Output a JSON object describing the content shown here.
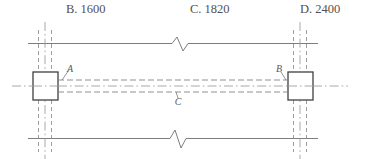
{
  "choices": {
    "items": [
      {
        "id": "choice-b",
        "label": "B. 1600"
      },
      {
        "id": "choice-c",
        "label": "C. 1820"
      },
      {
        "id": "choice-d",
        "label": "D. 2400"
      }
    ]
  },
  "diagram": {
    "type": "engineering-sectional-drawing",
    "labels": [
      {
        "id": "label-a",
        "text": "A",
        "x": 70,
        "y": 50
      },
      {
        "id": "label-b",
        "text": "B",
        "x": 279,
        "y": 50
      },
      {
        "id": "label-c",
        "text": "C",
        "x": 175,
        "y": 80
      }
    ],
    "colors": {
      "line": "#6b6b6b",
      "block_outline": "#3c3c3c",
      "centerline": "#8c8c8c",
      "hidden_line": "#7a7a7a",
      "text": "#555052",
      "background": "#ffffff"
    },
    "geometry": {
      "top_rail_y": 21,
      "bottom_rail_y": 116,
      "rail_left_x": 28,
      "rail_right_x": 318,
      "axis_y": 64,
      "left_block": {
        "x": 33,
        "y": 50,
        "w": 25,
        "h": 28
      },
      "right_block": {
        "x": 288,
        "y": 50,
        "w": 25,
        "h": 28
      },
      "break_top_x": 180,
      "break_bottom_x": 178,
      "hidden_lines_y": [
        58,
        64,
        70
      ]
    }
  }
}
